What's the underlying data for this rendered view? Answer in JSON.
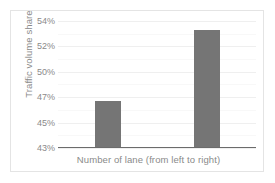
{
  "chart_data": {
    "type": "bar",
    "title": "",
    "xlabel": "Number of  lane (from left to right)",
    "ylabel": "Traffic volume share",
    "categories": [
      "1",
      "2"
    ],
    "values": [
      46.7,
      53.3
    ],
    "value_labels": [
      "46.7%",
      "53.3%"
    ],
    "ytick_labels": [
      "43%",
      "45%",
      "47%",
      "50%",
      "52%",
      "54%"
    ],
    "ytick_values": [
      43,
      45,
      47,
      50,
      52,
      54
    ],
    "ylim": [
      43,
      54
    ],
    "grid": true,
    "legend": false,
    "bar_color": "#757575",
    "gridline_color": "#efefef",
    "axis_color": "#6b6b6b",
    "text_color": "#8a8a8a"
  }
}
